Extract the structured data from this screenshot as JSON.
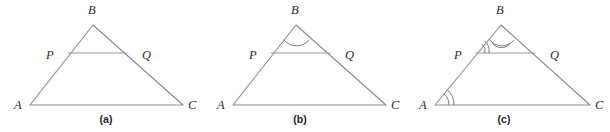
{
  "figure": {
    "background_color": "#ffffff",
    "line_color": "#8d8d8d",
    "arc_color": "#7b7b7b",
    "label_color": "#2b2b2b"
  },
  "panels": [
    {
      "id": "a",
      "caption": "(a)",
      "caption_pos": {
        "x": 106,
        "y": 114
      },
      "vertices": {
        "A": {
          "x": 30,
          "y": 105
        },
        "B": {
          "x": 93,
          "y": 25
        },
        "C": {
          "x": 183,
          "y": 105
        },
        "P": {
          "x": 68,
          "y": 53
        },
        "Q": {
          "x": 127,
          "y": 53
        }
      },
      "labels": [
        {
          "name": "A",
          "text": "A",
          "x": 14,
          "y": 99
        },
        {
          "name": "B",
          "text": "B",
          "x": 88,
          "y": 4
        },
        {
          "name": "C",
          "text": "C",
          "x": 188,
          "y": 99
        },
        {
          "name": "P",
          "text": "P",
          "x": 46,
          "y": 49
        },
        {
          "name": "Q",
          "text": "Q",
          "x": 142,
          "y": 49
        }
      ],
      "angle_marks": []
    },
    {
      "id": "b",
      "caption": "(b)",
      "caption_pos": {
        "x": 97,
        "y": 114
      },
      "vertices": {
        "A": {
          "x": 30,
          "y": 105
        },
        "B": {
          "x": 93,
          "y": 25
        },
        "C": {
          "x": 183,
          "y": 105
        },
        "P": {
          "x": 68,
          "y": 53
        },
        "Q": {
          "x": 127,
          "y": 53
        }
      },
      "labels": [
        {
          "name": "A",
          "text": "A",
          "x": 14,
          "y": 99
        },
        {
          "name": "B",
          "text": "B",
          "x": 88,
          "y": 4
        },
        {
          "name": "C",
          "text": "C",
          "x": 188,
          "y": 99
        },
        {
          "name": "P",
          "text": "P",
          "x": 46,
          "y": 49
        },
        {
          "name": "Q",
          "text": "Q",
          "x": 142,
          "y": 49
        }
      ],
      "angle_marks": [
        {
          "vertex": "B",
          "arcs": 1,
          "description": "single arc at apex B"
        }
      ]
    },
    {
      "id": "c",
      "caption": "(c)",
      "caption_pos": {
        "x": 98,
        "y": 114
      },
      "vertices": {
        "A": {
          "x": 29,
          "y": 105
        },
        "B": {
          "x": 95,
          "y": 25
        },
        "C": {
          "x": 184,
          "y": 105
        },
        "P": {
          "x": 70,
          "y": 53
        },
        "Q": {
          "x": 129,
          "y": 53
        }
      },
      "labels": [
        {
          "name": "A",
          "text": "A",
          "x": 13,
          "y": 99
        },
        {
          "name": "B",
          "text": "B",
          "x": 90,
          "y": 4
        },
        {
          "name": "C",
          "text": "C",
          "x": 189,
          "y": 99
        },
        {
          "name": "P",
          "text": "P",
          "x": 48,
          "y": 49
        },
        {
          "name": "Q",
          "text": "Q",
          "x": 144,
          "y": 49
        }
      ],
      "angle_marks": [
        {
          "vertex": "B",
          "arcs": 2,
          "description": "double arc at apex B"
        },
        {
          "vertex": "P",
          "arcs": 2,
          "description": "double arc at P between PB and PQ"
        },
        {
          "vertex": "A",
          "arcs": 2,
          "description": "double arc at A between AB and AC"
        }
      ]
    }
  ]
}
